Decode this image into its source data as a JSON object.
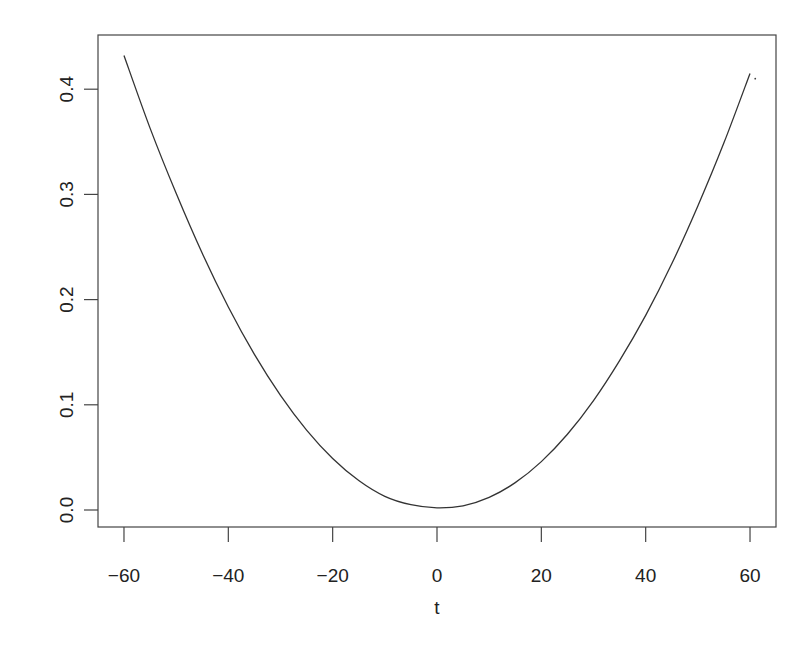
{
  "chart_data": {
    "type": "line",
    "title": "",
    "xlabel": "t",
    "ylabel": "",
    "xlim": [
      -64,
      64
    ],
    "ylim": [
      -0.016,
      0.451
    ],
    "grid": false,
    "legend": null,
    "x_ticks": [
      -60,
      -40,
      -20,
      0,
      20,
      40,
      60
    ],
    "x_tick_labels": [
      "−60",
      "−40",
      "−20",
      "0",
      "20",
      "40",
      "60"
    ],
    "y_ticks": [
      0.0,
      0.1,
      0.2,
      0.3,
      0.4
    ],
    "y_tick_labels": [
      "0.0",
      "0.1",
      "0.2",
      "0.3",
      "0.4"
    ],
    "series": [
      {
        "name": "curve",
        "color": "#333333",
        "x": [
          -60,
          -55,
          -50,
          -45,
          -40,
          -35,
          -30,
          -25,
          -20,
          -15,
          -10,
          -5,
          0,
          5,
          10,
          15,
          20,
          25,
          30,
          35,
          40,
          45,
          50,
          55,
          60
        ],
        "y": [
          0.432,
          0.363,
          0.301,
          0.244,
          0.193,
          0.148,
          0.109,
          0.076,
          0.049,
          0.028,
          0.013,
          0.005,
          0.002,
          0.004,
          0.012,
          0.026,
          0.046,
          0.072,
          0.104,
          0.142,
          0.185,
          0.234,
          0.289,
          0.349,
          0.415
        ]
      }
    ],
    "annotations": [
      {
        "type": "dot",
        "x": 61,
        "y": 0.41
      }
    ]
  },
  "plot_area": {
    "left": 98,
    "top": 35,
    "right": 776,
    "bottom": 527
  }
}
